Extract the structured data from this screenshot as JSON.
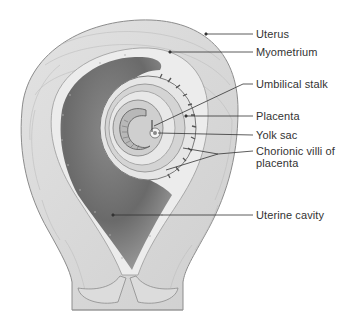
{
  "figure": {
    "colors": {
      "background": "#ffffff",
      "myometrium": "#d9d9d9",
      "myometrium_stroke": "#8c8c8c",
      "endometrium": "#ececec",
      "cavity": "#6e6e6e",
      "cavity_light": "#9a9a9a",
      "label_text": "#333333",
      "leader_line": "#333333"
    }
  },
  "labels": [
    {
      "id": "uterus",
      "text": "Uterus"
    },
    {
      "id": "myometrium",
      "text": "Myometrium"
    },
    {
      "id": "umbilical-stalk",
      "text": "Umbilical stalk"
    },
    {
      "id": "placenta",
      "text": "Placenta"
    },
    {
      "id": "yolk-sac",
      "text": "Yolk sac"
    },
    {
      "id": "chorionic-villi",
      "text": "Chorionic villi of placenta"
    },
    {
      "id": "uterine-cavity",
      "text": "Uterine cavity"
    }
  ]
}
